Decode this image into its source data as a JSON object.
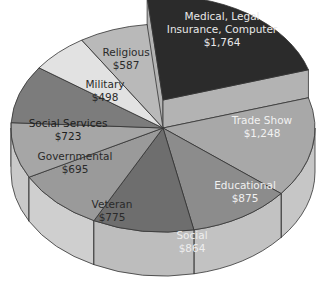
{
  "chart_data": {
    "type": "pie",
    "style": "3d-exploded",
    "title": "",
    "total": 8029,
    "exploded": "Medical, Legal Insurance, Computer",
    "slices": [
      {
        "label_lines": [
          "Medical, Legal",
          "Insurance, Computer"
        ],
        "name": "Medical, Legal Insurance, Computer",
        "value": 1764,
        "value_label": "$1,764",
        "top": "#2b2b2b",
        "side": "#b3b3b3",
        "text": "#e8e8e8",
        "explode": 28
      },
      {
        "label_lines": [
          "Trade Show"
        ],
        "name": "Trade Show",
        "value": 1248,
        "value_label": "$1,248",
        "top": "#a8a8a8",
        "side": "#c6c6c6",
        "text": "#f2f2f2",
        "explode": 0
      },
      {
        "label_lines": [
          "Educational"
        ],
        "name": "Educational",
        "value": 875,
        "value_label": "$875",
        "top": "#8c8c8c",
        "side": "#c2c2c2",
        "text": "#f0f0f0",
        "explode": 0
      },
      {
        "label_lines": [
          "Social"
        ],
        "name": "Social",
        "value": 864,
        "value_label": "$864",
        "top": "#6e6e6e",
        "side": "#bdbdbd",
        "text": "#eeeeee",
        "explode": 0
      },
      {
        "label_lines": [
          "Veteran"
        ],
        "name": "Veteran",
        "value": 775,
        "value_label": "$775",
        "top": "#9a9a9a",
        "side": "#cfcfcf",
        "text": "#2a2a2a",
        "explode": 0
      },
      {
        "label_lines": [
          "Governmental"
        ],
        "name": "Governmental",
        "value": 695,
        "value_label": "$695",
        "top": "#a6a6a6",
        "side": "#c9c9c9",
        "text": "#2a2a2a",
        "explode": 0
      },
      {
        "label_lines": [
          "Social Services"
        ],
        "name": "Social Services",
        "value": 723,
        "value_label": "$723",
        "top": "#7c7c7c",
        "side": "#bcbcbc",
        "text": "#1e1e1e",
        "explode": 0
      },
      {
        "label_lines": [
          "Military"
        ],
        "name": "Military",
        "value": 498,
        "value_label": "$498",
        "top": "#e2e2e2",
        "side": "#d0d0d0",
        "text": "#2a2a2a",
        "explode": 0
      },
      {
        "label_lines": [
          "Religious"
        ],
        "name": "Religious",
        "value": 587,
        "value_label": "$587",
        "top": "#b9b9b9",
        "side": "#d6d6d6",
        "text": "#2a2a2a",
        "explode": 0
      }
    ],
    "geometry": {
      "cx": 163,
      "cy": 128,
      "rx": 152,
      "ry": 104,
      "depth": 44,
      "start_angle_deg": -96,
      "gap_deg": 0
    },
    "label_positions": [
      [
        222,
        33
      ],
      [
        262,
        130
      ],
      [
        245,
        195
      ],
      [
        192,
        245
      ],
      [
        112,
        214
      ],
      [
        75,
        166
      ],
      [
        68,
        133
      ],
      [
        105,
        94
      ],
      [
        126,
        62
      ]
    ]
  }
}
